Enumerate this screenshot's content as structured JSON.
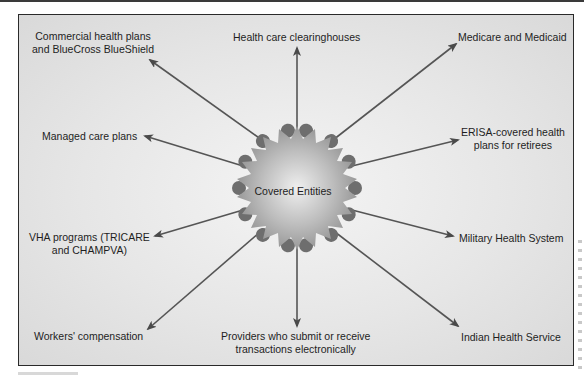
{
  "diagram": {
    "center": {
      "label": "Covered Entities"
    },
    "entities": [
      {
        "id": "commercial",
        "lines": [
          "Commercial health plans",
          "and BlueCross BlueShield"
        ]
      },
      {
        "id": "clearinghouses",
        "lines": [
          "Health care clearinghouses"
        ]
      },
      {
        "id": "medicare",
        "lines": [
          "Medicare and Medicaid"
        ]
      },
      {
        "id": "managed-care",
        "lines": [
          "Managed care plans"
        ]
      },
      {
        "id": "erisa",
        "lines": [
          "ERISA-covered health",
          "plans for retirees"
        ]
      },
      {
        "id": "vha",
        "lines": [
          "VHA programs (TRICARE",
          "and CHAMPVA)"
        ]
      },
      {
        "id": "military",
        "lines": [
          "Military Health System"
        ]
      },
      {
        "id": "workers-comp",
        "lines": [
          "Workers' compensation"
        ]
      },
      {
        "id": "providers",
        "lines": [
          "Providers who submit or receive",
          "transactions electronically"
        ]
      },
      {
        "id": "indian-health",
        "lines": [
          "Indian Health Service"
        ]
      }
    ]
  },
  "colors": {
    "frame_border": "#2a2a2a",
    "background": "#e6e6e6",
    "arrow": "#4a4a4a",
    "starburst_fill": "#a8a8a8",
    "starburst_bumps": "#6e6e6e",
    "text": "#1e1e1e"
  }
}
